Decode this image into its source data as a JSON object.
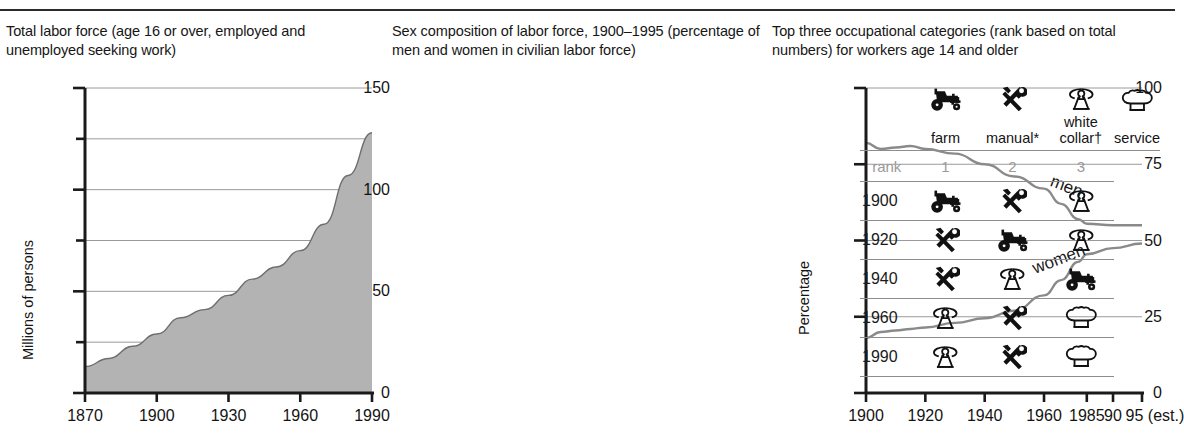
{
  "panel1": {
    "caption": "Total labor force (age 16 or over, employed and unemployed seeking work)",
    "chart_data": {
      "type": "area",
      "title": "Total labor force (age 16 or over, employed and unemployed seeking work)",
      "xlabel": "",
      "ylabel": "Millions of persons",
      "ylim": [
        0,
        150
      ],
      "xlim": [
        1870,
        1990
      ],
      "ytick_labels": [
        "0",
        "50",
        "100",
        "150"
      ],
      "ytick_values": [
        0,
        50,
        100,
        150
      ],
      "ygrid_values": [
        25,
        50,
        75,
        100,
        125,
        150
      ],
      "xtick_labels": [
        "1870",
        "1900",
        "1930",
        "1960",
        "1990"
      ],
      "xtick_values": [
        1870,
        1900,
        1930,
        1960,
        1990
      ],
      "grid": true,
      "fill_color": "#b3b3b3",
      "x": [
        1870,
        1880,
        1890,
        1900,
        1910,
        1920,
        1930,
        1940,
        1950,
        1960,
        1970,
        1980,
        1990
      ],
      "values": [
        13,
        17,
        23,
        29,
        37,
        41,
        48,
        56,
        62,
        70,
        83,
        107,
        128
      ]
    }
  },
  "panel2": {
    "caption": "Sex composition of labor force, 1900–1995 (percentage of men and women in civilian labor force)",
    "chart_data": {
      "type": "line",
      "title": "Sex composition of labor force, 1900–1995 (percentage of men and women in civilian labor force)",
      "xlabel": "",
      "ylabel": "Percentage",
      "ylim": [
        0,
        100
      ],
      "ytick_labels": [
        "0",
        "25",
        "50",
        "75",
        "100"
      ],
      "ytick_values": [
        0,
        25,
        50,
        75,
        100
      ],
      "grid": true,
      "xtick_labels": [
        "1900",
        "1920",
        "1940",
        "1960",
        "1985",
        "90",
        "95 (est.)"
      ],
      "xtick_values": [
        1900,
        1920,
        1940,
        1960,
        1985,
        1990,
        1995
      ],
      "line_color": "#8a8a8a",
      "annotations": [
        "men",
        "women"
      ],
      "x": [
        1900,
        1905,
        1910,
        1915,
        1920,
        1930,
        1940,
        1950,
        1960,
        1970,
        1980,
        1985,
        1990,
        1995
      ],
      "series": [
        {
          "name": "men",
          "values": [
            82,
            80,
            80.5,
            81,
            80,
            78.5,
            75,
            71,
            67,
            62,
            57,
            55.5,
            55,
            55
          ]
        },
        {
          "name": "women",
          "values": [
            18,
            20,
            20.5,
            21,
            21.5,
            23,
            24.5,
            27,
            32,
            37,
            43,
            45.5,
            47.5,
            49
          ]
        }
      ]
    }
  },
  "panel3": {
    "caption": "Top three occupational categories (rank based on total numbers) for workers age 14 and older",
    "legend": [
      {
        "icon": "tractor-icon",
        "label": "farm"
      },
      {
        "icon": "tools-icon",
        "label": "manual*"
      },
      {
        "icon": "telephone-icon",
        "label": "white collar†"
      },
      {
        "icon": "chef-hat-icon",
        "label": "service"
      }
    ],
    "rank_header": {
      "label": "rank",
      "ranks": [
        "1",
        "2",
        "3"
      ]
    },
    "rows": [
      {
        "year": "1900",
        "rank1": "tractor-icon",
        "rank2": "tools-icon",
        "rank3": "telephone-icon"
      },
      {
        "year": "1920",
        "rank1": "tools-icon",
        "rank2": "tractor-icon",
        "rank3": "telephone-icon"
      },
      {
        "year": "1940",
        "rank1": "tools-icon",
        "rank2": "telephone-icon",
        "rank3": "tractor-icon"
      },
      {
        "year": "1960",
        "rank1": "telephone-icon",
        "rank2": "tools-icon",
        "rank3": "chef-hat-icon"
      },
      {
        "year": "1990",
        "rank1": "telephone-icon",
        "rank2": "tools-icon",
        "rank3": "chef-hat-icon"
      }
    ]
  }
}
